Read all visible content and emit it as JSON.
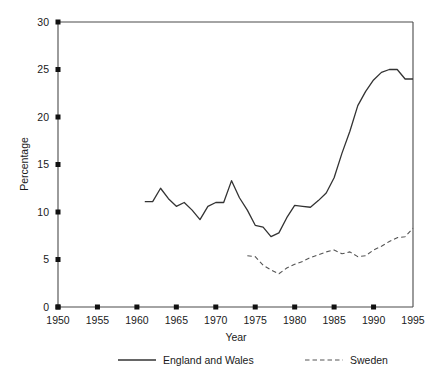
{
  "chart_data": {
    "type": "line",
    "title": "",
    "xlabel": "Year",
    "ylabel": "Percentage",
    "xlim": [
      1950,
      1995
    ],
    "ylim": [
      0,
      30
    ],
    "xticks": [
      1950,
      1955,
      1960,
      1965,
      1970,
      1975,
      1980,
      1985,
      1990,
      1995
    ],
    "yticks": [
      0,
      5,
      10,
      15,
      20,
      25,
      30
    ],
    "grid": false,
    "legend_position": "bottom",
    "series": [
      {
        "name": "England and Wales",
        "style": "solid",
        "color": "#333333",
        "x": [
          1961,
          1962,
          1963,
          1964,
          1965,
          1966,
          1967,
          1968,
          1969,
          1970,
          1971,
          1972,
          1973,
          1974,
          1975,
          1976,
          1977,
          1978,
          1979,
          1980,
          1981,
          1982,
          1983,
          1984,
          1985,
          1986,
          1987,
          1988,
          1989,
          1990,
          1991,
          1992,
          1993,
          1994,
          1995
        ],
        "values": [
          11.1,
          11.1,
          12.5,
          11.4,
          10.6,
          11.0,
          10.2,
          9.2,
          10.6,
          11.0,
          11.0,
          13.3,
          11.5,
          10.2,
          8.6,
          8.4,
          7.4,
          7.8,
          9.4,
          10.7,
          10.6,
          10.5,
          11.2,
          12.0,
          13.6,
          16.2,
          18.5,
          21.2,
          22.7,
          23.9,
          24.7,
          25.0,
          25.0,
          24.0,
          24.0
        ]
      },
      {
        "name": "Sweden",
        "style": "dashed",
        "color": "#555555",
        "x": [
          1974,
          1975,
          1976,
          1977,
          1978,
          1979,
          1980,
          1981,
          1982,
          1983,
          1984,
          1985,
          1986,
          1987,
          1988,
          1989,
          1990,
          1991,
          1992,
          1993,
          1994,
          1995
        ],
        "values": [
          5.4,
          5.3,
          4.4,
          3.9,
          3.5,
          4.1,
          4.5,
          4.8,
          5.2,
          5.5,
          5.8,
          6.0,
          5.6,
          5.8,
          5.3,
          5.4,
          6.0,
          6.4,
          6.9,
          7.3,
          7.4,
          8.3
        ]
      }
    ]
  },
  "legend": {
    "entries": [
      {
        "label": "England and Wales",
        "style": "solid"
      },
      {
        "label": "Sweden",
        "style": "dashed"
      }
    ]
  }
}
